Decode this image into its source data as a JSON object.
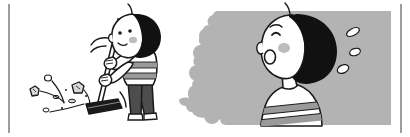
{
  "illustration": {
    "title": "Two-panel cartoon: child sweeping with a broom, and a worried child sweating",
    "canvas": {
      "width": 410,
      "height": 137,
      "background": "#ffffff"
    },
    "palette": {
      "ink": "#1a1a1a",
      "hair_black": "#111111",
      "skin_white": "#ffffff",
      "panel_gray": "#b3b3b3",
      "stripe_gray": "#9a9a9a",
      "pants_gray": "#4d4d4d",
      "blush_gray": "#bdbdbd",
      "border_gray": "#9e9e9e",
      "debris_gray": "#d9d9d9"
    },
    "borders": {
      "left_rule": {
        "x": 8,
        "y": 4,
        "width": 2,
        "height": 129,
        "color": "#9e9e9e"
      },
      "right_rule": {
        "x": 400,
        "y": 4,
        "width": 2,
        "height": 129,
        "color": "#9e9e9e"
      }
    },
    "panels": [
      {
        "name": "left-panel-sweeping",
        "label": "Child sweeping debris with a broom",
        "background": "#ffffff"
      },
      {
        "name": "right-panel-worried",
        "label": "Close-up of worried child with sweat drops",
        "background": "#b3b3b3",
        "rect": {
          "x": 205,
          "y": 11,
          "width": 186,
          "height": 114
        }
      }
    ],
    "elements": {
      "sweeper_child": {
        "name": "sweeping-child",
        "hair": "black bowl cut",
        "shirt": "white with gray horizontal stripes",
        "pants": "dark gray",
        "pose": "bent forward, both hands on broom handle"
      },
      "broom": {
        "name": "broom",
        "handle_color": "#ffffff",
        "head_color": "#1a1a1a"
      },
      "motion_lines": {
        "name": "motion-lines",
        "count": 3
      },
      "debris": {
        "name": "floor-debris",
        "count": 9,
        "color": "#d9d9d9"
      },
      "worried_child": {
        "name": "worried-child",
        "hair": "black bowl cut",
        "expression": "open mouth, raised eyebrow",
        "blush": true,
        "shirt": "white with gray horizontal stripes"
      },
      "sweat_drops": {
        "name": "sweat-drops",
        "count": 3,
        "color": "#ffffff"
      }
    }
  }
}
